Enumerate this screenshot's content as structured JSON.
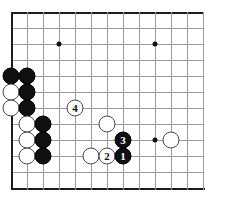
{
  "figure": {
    "name": "go-board-diagram",
    "board_size": 19,
    "view": "bottom-left-corner",
    "background_color": "#ffffff",
    "grid_color": "#9a9a9a",
    "edge_color": "#1c1c1c",
    "black_color": "#101010",
    "white_color": "#ffffff"
  },
  "geometry": {
    "origin_x": 11,
    "origin_y": 12,
    "cell": 16,
    "cols": 13,
    "rows": 12,
    "stone_diameter": 17
  },
  "star_points": [
    {
      "name": "star-point-upper-left",
      "col": 3,
      "row": 2
    },
    {
      "name": "star-point-upper-right",
      "col": 9,
      "row": 2
    },
    {
      "name": "star-point-lower-right",
      "col": 9,
      "row": 8
    }
  ],
  "stones": [
    {
      "name": "black-stone-a",
      "color": "black",
      "col": 0,
      "row": 4,
      "label": ""
    },
    {
      "name": "black-stone-b",
      "color": "black",
      "col": 1,
      "row": 4,
      "label": ""
    },
    {
      "name": "white-stone-a",
      "color": "white",
      "col": 0,
      "row": 5,
      "label": ""
    },
    {
      "name": "black-stone-c",
      "color": "black",
      "col": 1,
      "row": 5,
      "label": ""
    },
    {
      "name": "white-stone-b",
      "color": "white",
      "col": 0,
      "row": 6,
      "label": ""
    },
    {
      "name": "black-stone-d",
      "color": "black",
      "col": 1,
      "row": 6,
      "label": ""
    },
    {
      "name": "white-stone-c",
      "color": "white",
      "col": 1,
      "row": 7,
      "label": ""
    },
    {
      "name": "black-stone-e",
      "color": "black",
      "col": 2,
      "row": 7,
      "label": ""
    },
    {
      "name": "white-stone-d",
      "color": "white",
      "col": 1,
      "row": 8,
      "label": ""
    },
    {
      "name": "black-stone-f",
      "color": "black",
      "col": 2,
      "row": 8,
      "label": ""
    },
    {
      "name": "white-stone-e",
      "color": "white",
      "col": 1,
      "row": 9,
      "label": ""
    },
    {
      "name": "black-stone-g",
      "color": "black",
      "col": 2,
      "row": 9,
      "label": ""
    },
    {
      "name": "white-move-4",
      "color": "white",
      "col": 4,
      "row": 6,
      "label": "4"
    },
    {
      "name": "white-stone-f",
      "color": "white",
      "col": 6,
      "row": 7,
      "label": ""
    },
    {
      "name": "white-stone-g",
      "color": "white",
      "col": 5,
      "row": 9,
      "label": ""
    },
    {
      "name": "white-move-2",
      "color": "white",
      "col": 6,
      "row": 9,
      "label": "2"
    },
    {
      "name": "black-move-3",
      "color": "black",
      "col": 7,
      "row": 8,
      "label": "3"
    },
    {
      "name": "black-move-1",
      "color": "black",
      "col": 7,
      "row": 9,
      "label": "1"
    },
    {
      "name": "white-stone-h",
      "color": "white",
      "col": 10,
      "row": 8,
      "label": ""
    }
  ],
  "move_sequence": [
    {
      "number": "1",
      "color": "black"
    },
    {
      "number": "2",
      "color": "white"
    },
    {
      "number": "3",
      "color": "black"
    },
    {
      "number": "4",
      "color": "white"
    }
  ]
}
